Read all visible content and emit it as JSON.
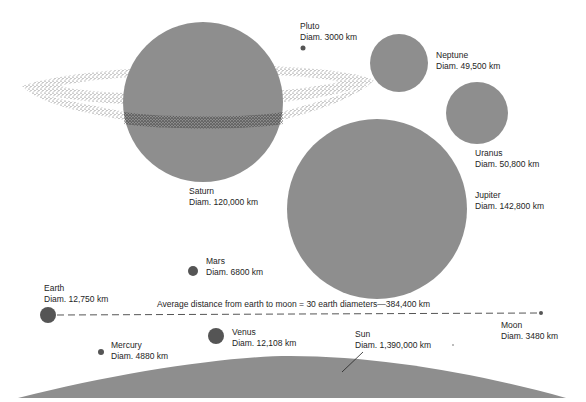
{
  "diagram": {
    "fill_color": "#8e8e8e",
    "dark_fill_color": "#555555",
    "bodies": [
      {
        "id": "pluto",
        "name": "Pluto",
        "diameter": "Diam. 3000 km"
      },
      {
        "id": "neptune",
        "name": "Neptune",
        "diameter": "Diam. 49,500 km"
      },
      {
        "id": "uranus",
        "name": "Uranus",
        "diameter": "Diam. 50,800 km"
      },
      {
        "id": "saturn",
        "name": "Saturn",
        "diameter": "Diam. 120,000 km"
      },
      {
        "id": "jupiter",
        "name": "Jupiter",
        "diameter": "Diam. 142,800 km"
      },
      {
        "id": "mars",
        "name": "Mars",
        "diameter": "Diam. 6800 km"
      },
      {
        "id": "earth",
        "name": "Earth",
        "diameter": "Diam. 12,750 km"
      },
      {
        "id": "moon",
        "name": "Moon",
        "diameter": "Diam. 3480 km"
      },
      {
        "id": "mercury",
        "name": "Mercury",
        "diameter": "Diam. 4880 km"
      },
      {
        "id": "venus",
        "name": "Venus",
        "diameter": "Diam. 12,108 km"
      },
      {
        "id": "sun",
        "name": "Sun",
        "diameter": "Diam. 1,390,000 km"
      }
    ],
    "earth_moon_caption": "Average distance from earth to moon = 30 earth diameters—384,400 km"
  }
}
